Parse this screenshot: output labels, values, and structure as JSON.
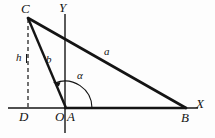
{
  "figure": {
    "type": "geometry-diagram",
    "background_color": "#fdfdfd",
    "line_color": "#141414",
    "labels": {
      "vertex_c": "C",
      "vertex_b": "B",
      "point_o": "O",
      "point_a": "A",
      "point_d": "D",
      "axis_y": "Y",
      "axis_x": "X",
      "side_a": "a",
      "side_b": "b",
      "height_h": "h",
      "angle_alpha": "α"
    },
    "geometry": {
      "origin": [
        65,
        108
      ],
      "vertex_c": [
        28,
        18
      ],
      "vertex_b": [
        186,
        108
      ],
      "point_d": [
        28,
        108
      ],
      "x_axis": [
        8,
        108,
        198,
        108
      ],
      "y_axis": [
        65,
        14,
        65,
        133
      ],
      "dashed_height": [
        28,
        18,
        28,
        108
      ],
      "angle_arc_radius": 27,
      "angle_arc_start_deg": 0,
      "angle_arc_end_deg": 112
    }
  }
}
